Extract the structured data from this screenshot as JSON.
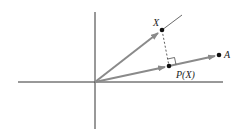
{
  "diagram": {
    "type": "vector-projection",
    "labels": {
      "x_vector": "X",
      "a_vector": "A",
      "projection": "P(X)"
    },
    "colors": {
      "axis": "#222222",
      "vector": "#8a8a8a",
      "point": "#111111",
      "dashed": "#333333",
      "background": "#ffffff"
    },
    "geometry": {
      "origin": [
        95,
        82
      ],
      "x_axis": [
        [
          18,
          82
        ],
        [
          223,
          82
        ]
      ],
      "y_axis": [
        [
          95,
          12
        ],
        [
          95,
          129
        ]
      ],
      "point_X": [
        162,
        30
      ],
      "point_A": [
        219,
        55
      ],
      "point_PX": [
        169,
        66
      ],
      "line_X_extension_end": [
        182,
        15
      ]
    }
  }
}
